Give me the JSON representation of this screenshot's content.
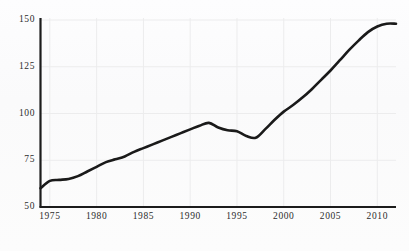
{
  "chart_data": {
    "type": "line",
    "title": "",
    "subtitle": "",
    "xlabel": "",
    "ylabel": "",
    "xlim": [
      1974,
      2012
    ],
    "ylim": [
      50,
      150
    ],
    "grid": true,
    "legend": null,
    "legend_position": "none",
    "series_color": "#1a1a1a",
    "axis_color": "#1c1c1c",
    "grid_color": "#ececed",
    "y_ticks": [
      50,
      75,
      100,
      125,
      150
    ],
    "y_tick_labels": [
      "50",
      "75",
      "100",
      "125",
      "150"
    ],
    "x_ticks": [
      1975,
      1980,
      1985,
      1990,
      1995,
      2000,
      2005,
      2010
    ],
    "x_tick_labels": [
      "1975",
      "1980",
      "1985",
      "1990",
      "1995",
      "2000",
      "2005",
      "2010"
    ],
    "x": [
      1974,
      1975,
      1976,
      1977,
      1978,
      1979,
      1980,
      1981,
      1982,
      1983,
      1984,
      1985,
      1986,
      1987,
      1988,
      1989,
      1990,
      1991,
      1992,
      1993,
      1994,
      1995,
      1996,
      1997,
      1998,
      1999,
      2000,
      2001,
      2002,
      2003,
      2004,
      2005,
      2006,
      2007,
      2008,
      2009,
      2010,
      2011,
      2012
    ],
    "values": [
      60,
      64,
      64.5,
      65,
      66.5,
      69,
      71.5,
      74,
      75.5,
      77,
      79.5,
      81.5,
      83.5,
      85.5,
      87.5,
      89.5,
      91.5,
      93.5,
      95,
      92.5,
      91,
      90.5,
      88,
      87,
      91.5,
      96.5,
      101,
      104.5,
      108.5,
      113,
      118,
      123,
      128.5,
      134,
      139,
      143.5,
      146.5,
      148,
      148
    ],
    "series": [
      {
        "name": "value",
        "values": [
          60,
          64,
          64.5,
          65,
          66.5,
          69,
          71.5,
          74,
          75.5,
          77,
          79.5,
          81.5,
          83.5,
          85.5,
          87.5,
          89.5,
          91.5,
          93.5,
          95,
          92.5,
          91,
          90.5,
          88,
          87,
          91.5,
          96.5,
          101,
          104.5,
          108.5,
          113,
          118,
          123,
          128.5,
          134,
          139,
          143.5,
          146.5,
          148,
          148
        ]
      }
    ],
    "annotations": []
  }
}
